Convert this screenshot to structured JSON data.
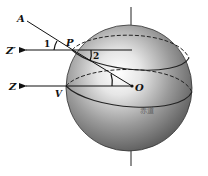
{
  "figure": {
    "labels": {
      "A": "A",
      "P": "P",
      "O": "O",
      "V": "V",
      "Z_prime": "Z′",
      "Z": "Z",
      "angle1": "1",
      "angle2": "2",
      "equator": "赤道"
    },
    "colors": {
      "ink": "#111111",
      "sphere_light": "#f4f4f4",
      "sphere_dark": "#5a5a5a",
      "background": "#ffffff"
    },
    "geometry": {
      "sphere_center": [
        129,
        88
      ],
      "sphere_radius": 63,
      "point_P": [
        73,
        50
      ],
      "point_A": [
        26,
        20
      ],
      "point_O": [
        132,
        86
      ],
      "point_V": [
        66,
        86
      ],
      "zprime_arrow_tip": [
        24,
        50
      ],
      "z_arrow_tip": [
        24,
        86
      ]
    }
  }
}
